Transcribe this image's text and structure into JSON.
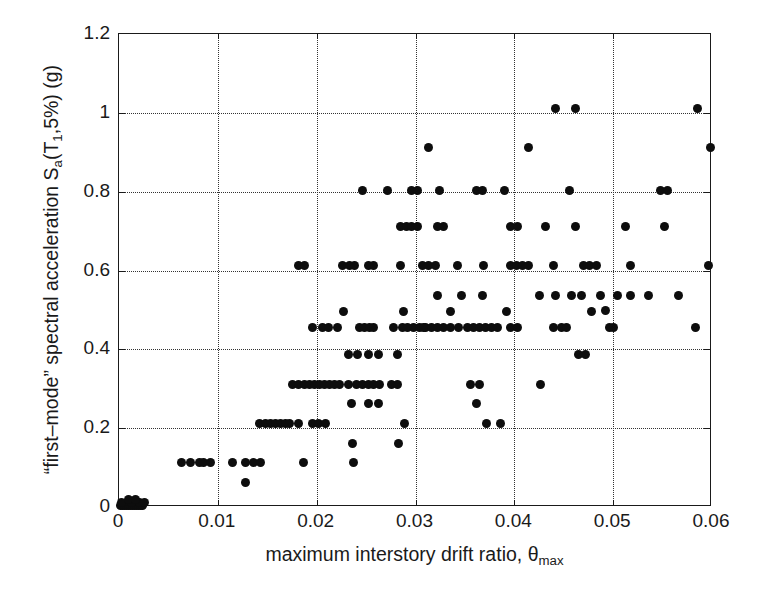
{
  "figure": {
    "type": "scatter-plot",
    "background_color": "#ffffff",
    "point_color": "#0d0d0d",
    "grid_color": "#333333",
    "axis_color": "#1a1a1a"
  },
  "axes": {
    "x": {
      "label_prefix": "maximum interstory drift ratio, ",
      "label_symbol": "θ",
      "label_subscript": "max",
      "ticks": [
        0,
        0.01,
        0.02,
        0.03,
        0.04,
        0.05,
        0.06
      ],
      "tick_labels": [
        "0",
        "0.01",
        "0.02",
        "0.03",
        "0.04",
        "0.05",
        "0.06"
      ],
      "min": 0,
      "max": 0.06
    },
    "y": {
      "label_part1": "“first–mode” spectral acceleration S",
      "label_sub_a": "a",
      "label_part2": "(T",
      "label_sub_1": "1",
      "label_part3": ",5%) (g)",
      "ticks": [
        0,
        0.2,
        0.4,
        0.6,
        0.8,
        1.0,
        1.2
      ],
      "tick_labels": [
        "0",
        "0.2",
        "0.4",
        "0.6",
        "0.8",
        "1",
        "1.2"
      ],
      "min": 0,
      "max": 1.2
    }
  },
  "chart_data": {
    "type": "scatter",
    "title": "",
    "xlabel": "maximum interstory drift ratio, θmax",
    "ylabel": "\"first-mode\" spectral acceleration Sa(T1,5%) (g)",
    "xlim": [
      0,
      0.06
    ],
    "ylim": [
      0,
      1.2
    ],
    "xticks": [
      0,
      0.01,
      0.02,
      0.03,
      0.04,
      0.05,
      0.06
    ],
    "yticks": [
      0,
      0.2,
      0.4,
      0.6,
      0.8,
      1,
      1.2
    ],
    "grid": true,
    "grid_style": "dotted",
    "legend": null,
    "marker": "filled-circle",
    "marker_size_px": 9,
    "points": [
      [
        0.0002,
        0.005
      ],
      [
        0.0004,
        0.005
      ],
      [
        0.0006,
        0.005
      ],
      [
        0.0008,
        0.005
      ],
      [
        0.001,
        0.005
      ],
      [
        0.0012,
        0.005
      ],
      [
        0.0014,
        0.005
      ],
      [
        0.0016,
        0.005
      ],
      [
        0.0018,
        0.005
      ],
      [
        0.002,
        0.005
      ],
      [
        0.0022,
        0.005
      ],
      [
        0.0024,
        0.005
      ],
      [
        0.0003,
        0.012
      ],
      [
        0.0013,
        0.012
      ],
      [
        0.0021,
        0.012
      ],
      [
        0.0026,
        0.012
      ],
      [
        0.001,
        0.018
      ],
      [
        0.0017,
        0.018
      ],
      [
        0.0063,
        0.112
      ],
      [
        0.0072,
        0.112
      ],
      [
        0.0081,
        0.112
      ],
      [
        0.0086,
        0.112
      ],
      [
        0.0093,
        0.112
      ],
      [
        0.0115,
        0.112
      ],
      [
        0.0128,
        0.112
      ],
      [
        0.0136,
        0.112
      ],
      [
        0.0143,
        0.112
      ],
      [
        0.0187,
        0.112
      ],
      [
        0.0237,
        0.112
      ],
      [
        0.0128,
        0.062
      ],
      [
        0.0142,
        0.212
      ],
      [
        0.0148,
        0.212
      ],
      [
        0.0153,
        0.212
      ],
      [
        0.0158,
        0.212
      ],
      [
        0.0163,
        0.212
      ],
      [
        0.0168,
        0.212
      ],
      [
        0.0173,
        0.212
      ],
      [
        0.0182,
        0.212
      ],
      [
        0.0196,
        0.212
      ],
      [
        0.0202,
        0.212
      ],
      [
        0.0209,
        0.212
      ],
      [
        0.0289,
        0.212
      ],
      [
        0.0372,
        0.212
      ],
      [
        0.0386,
        0.212
      ],
      [
        0.0236,
        0.162
      ],
      [
        0.0283,
        0.162
      ],
      [
        0.0176,
        0.312
      ],
      [
        0.0182,
        0.312
      ],
      [
        0.0188,
        0.312
      ],
      [
        0.0193,
        0.312
      ],
      [
        0.0198,
        0.312
      ],
      [
        0.0203,
        0.312
      ],
      [
        0.0208,
        0.312
      ],
      [
        0.0213,
        0.312
      ],
      [
        0.0218,
        0.312
      ],
      [
        0.0223,
        0.312
      ],
      [
        0.0232,
        0.312
      ],
      [
        0.024,
        0.312
      ],
      [
        0.0246,
        0.312
      ],
      [
        0.0252,
        0.312
      ],
      [
        0.0258,
        0.312
      ],
      [
        0.0264,
        0.312
      ],
      [
        0.0276,
        0.312
      ],
      [
        0.0282,
        0.312
      ],
      [
        0.0356,
        0.312
      ],
      [
        0.0365,
        0.312
      ],
      [
        0.0426,
        0.312
      ],
      [
        0.0235,
        0.262
      ],
      [
        0.0252,
        0.262
      ],
      [
        0.0263,
        0.262
      ],
      [
        0.0362,
        0.262
      ],
      [
        0.0232,
        0.386
      ],
      [
        0.0241,
        0.386
      ],
      [
        0.0252,
        0.386
      ],
      [
        0.0263,
        0.386
      ],
      [
        0.0282,
        0.386
      ],
      [
        0.0465,
        0.386
      ],
      [
        0.0472,
        0.386
      ],
      [
        0.0278,
        0.456
      ],
      [
        0.0287,
        0.456
      ],
      [
        0.0292,
        0.456
      ],
      [
        0.0298,
        0.456
      ],
      [
        0.0304,
        0.456
      ],
      [
        0.031,
        0.456
      ],
      [
        0.0316,
        0.456
      ],
      [
        0.0322,
        0.456
      ],
      [
        0.0328,
        0.456
      ],
      [
        0.0335,
        0.456
      ],
      [
        0.0344,
        0.456
      ],
      [
        0.0353,
        0.456
      ],
      [
        0.0359,
        0.456
      ],
      [
        0.0365,
        0.456
      ],
      [
        0.0371,
        0.456
      ],
      [
        0.0377,
        0.456
      ],
      [
        0.0383,
        0.456
      ],
      [
        0.0396,
        0.456
      ],
      [
        0.0403,
        0.456
      ],
      [
        0.0196,
        0.456
      ],
      [
        0.0206,
        0.456
      ],
      [
        0.0212,
        0.456
      ],
      [
        0.0221,
        0.456
      ],
      [
        0.0243,
        0.456
      ],
      [
        0.0248,
        0.456
      ],
      [
        0.0253,
        0.456
      ],
      [
        0.0258,
        0.456
      ],
      [
        0.0308,
        0.456
      ],
      [
        0.044,
        0.456
      ],
      [
        0.0448,
        0.456
      ],
      [
        0.0453,
        0.456
      ],
      [
        0.0496,
        0.456
      ],
      [
        0.05,
        0.456
      ],
      [
        0.0583,
        0.456
      ],
      [
        0.0227,
        0.496
      ],
      [
        0.0288,
        0.496
      ],
      [
        0.0335,
        0.496
      ],
      [
        0.0392,
        0.496
      ],
      [
        0.0478,
        0.496
      ],
      [
        0.0322,
        0.536
      ],
      [
        0.0347,
        0.536
      ],
      [
        0.0368,
        0.536
      ],
      [
        0.0425,
        0.536
      ],
      [
        0.0442,
        0.536
      ],
      [
        0.0458,
        0.536
      ],
      [
        0.0468,
        0.536
      ],
      [
        0.0487,
        0.536
      ],
      [
        0.0504,
        0.536
      ],
      [
        0.0518,
        0.536
      ],
      [
        0.0536,
        0.536
      ],
      [
        0.0566,
        0.536
      ],
      [
        0.0492,
        0.498
      ],
      [
        0.0182,
        0.612
      ],
      [
        0.0188,
        0.612
      ],
      [
        0.0226,
        0.612
      ],
      [
        0.0233,
        0.612
      ],
      [
        0.0238,
        0.612
      ],
      [
        0.0252,
        0.612
      ],
      [
        0.0258,
        0.612
      ],
      [
        0.0285,
        0.612
      ],
      [
        0.0307,
        0.612
      ],
      [
        0.0313,
        0.612
      ],
      [
        0.032,
        0.612
      ],
      [
        0.0343,
        0.612
      ],
      [
        0.0369,
        0.612
      ],
      [
        0.0396,
        0.612
      ],
      [
        0.0402,
        0.612
      ],
      [
        0.0408,
        0.612
      ],
      [
        0.0414,
        0.612
      ],
      [
        0.044,
        0.612
      ],
      [
        0.047,
        0.612
      ],
      [
        0.0476,
        0.612
      ],
      [
        0.0483,
        0.612
      ],
      [
        0.0518,
        0.612
      ],
      [
        0.0596,
        0.612
      ],
      [
        0.0285,
        0.712
      ],
      [
        0.0291,
        0.712
      ],
      [
        0.0296,
        0.712
      ],
      [
        0.0302,
        0.712
      ],
      [
        0.0322,
        0.712
      ],
      [
        0.0328,
        0.712
      ],
      [
        0.0396,
        0.712
      ],
      [
        0.0403,
        0.712
      ],
      [
        0.0432,
        0.712
      ],
      [
        0.0462,
        0.712
      ],
      [
        0.0512,
        0.712
      ],
      [
        0.0552,
        0.712
      ],
      [
        0.0246,
        0.802
      ],
      [
        0.0272,
        0.802
      ],
      [
        0.0296,
        0.802
      ],
      [
        0.0302,
        0.802
      ],
      [
        0.0324,
        0.802
      ],
      [
        0.0362,
        0.802
      ],
      [
        0.0368,
        0.802
      ],
      [
        0.039,
        0.802
      ],
      [
        0.0456,
        0.802
      ],
      [
        0.0548,
        0.802
      ],
      [
        0.0555,
        0.802
      ],
      [
        0.0313,
        0.912
      ],
      [
        0.0414,
        0.912
      ],
      [
        0.0598,
        0.912
      ],
      [
        0.0442,
        1.012
      ],
      [
        0.0462,
        1.012
      ],
      [
        0.0585,
        1.012
      ]
    ]
  }
}
